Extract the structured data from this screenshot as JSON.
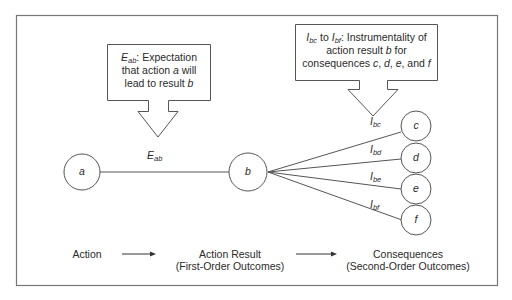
{
  "diagram": {
    "type": "expectancy-instrumentality-model",
    "frame": {
      "border_color": "#777777"
    },
    "callouts": {
      "expectation": {
        "symbol": "E",
        "symbol_sub": "ab",
        "text_after_symbol": ": Expectation",
        "line2_prefix": "that action ",
        "line2_var": "a",
        "line2_suffix": " will",
        "line3_prefix": "lead to result ",
        "line3_var": "b"
      },
      "instrumentality": {
        "sym1": "I",
        "sym1_sub": "bc",
        "to": " to ",
        "sym2": "I",
        "sym2_sub": "bf",
        "text_after": ": Instrumentality of",
        "line2_prefix": "action result ",
        "line2_var": "b",
        "line2_suffix": " for",
        "line3_prefix": "consequences ",
        "var_c": "c",
        "var_d": "d",
        "var_e": "e",
        "var_f": "f",
        "sep": ", ",
        "and": ", and "
      }
    },
    "nodes": {
      "a": "a",
      "b": "b",
      "c": "c",
      "d": "d",
      "e": "e",
      "f": "f"
    },
    "edges": {
      "ab": {
        "symbol": "E",
        "sub": "ab"
      },
      "bc": {
        "symbol": "I",
        "sub": "bc"
      },
      "bd": {
        "symbol": "I",
        "sub": "bd"
      },
      "be": {
        "symbol": "I",
        "sub": "be"
      },
      "bf": {
        "symbol": "I",
        "sub": "bf"
      }
    },
    "footer": {
      "stage1": "Action",
      "stage2_line1": "Action Result",
      "stage2_line2": "(First-Order Outcomes)",
      "stage3_line1": "Consequences",
      "stage3_line2": "(Second-Order Outcomes)"
    }
  }
}
